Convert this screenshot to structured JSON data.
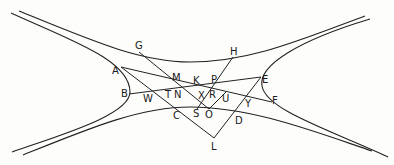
{
  "figure": {
    "width": 394,
    "height": 165,
    "stroke_color": "#222222",
    "background": "#fdfdfc"
  },
  "curves": [
    {
      "id": "upper-branch",
      "d": "M 19 11 C 90 40, 140 62, 190 62 C 250 62, 300 40, 365 16"
    },
    {
      "id": "lower-branch",
      "d": "M 23 155 C 90 128, 140 107, 190 107 C 250 107, 310 130, 372 151"
    },
    {
      "id": "left-branch",
      "d": "M 11 13 C 70 40, 130 60, 130 92 C 130 115, 60 135, 12 152"
    },
    {
      "id": "right-branch",
      "d": "M 370 19 C 300 40, 258 65, 262 86 C 266 110, 330 130, 388 157"
    }
  ],
  "segments": [
    {
      "id": "A-F",
      "x1": 121,
      "y1": 67,
      "x2": 272,
      "y2": 102
    },
    {
      "id": "B-E",
      "x1": 129,
      "y1": 94,
      "x2": 261,
      "y2": 77
    },
    {
      "id": "G-O",
      "x1": 139,
      "y1": 52,
      "x2": 209,
      "y2": 109
    },
    {
      "id": "H-S",
      "x1": 233,
      "y1": 57,
      "x2": 197,
      "y2": 109
    },
    {
      "id": "A-L",
      "x1": 121,
      "y1": 67,
      "x2": 214,
      "y2": 138
    },
    {
      "id": "E-L",
      "x1": 261,
      "y1": 77,
      "x2": 214,
      "y2": 138
    },
    {
      "id": "O-U",
      "x1": 209,
      "y1": 109,
      "x2": 226,
      "y2": 92
    }
  ],
  "labels": [
    {
      "text": "G",
      "x": 135,
      "y": 49
    },
    {
      "text": "H",
      "x": 230,
      "y": 55
    },
    {
      "text": "A",
      "x": 112,
      "y": 74
    },
    {
      "text": "M",
      "x": 172,
      "y": 81
    },
    {
      "text": "K",
      "x": 193,
      "y": 84
    },
    {
      "text": "P",
      "x": 211,
      "y": 83
    },
    {
      "text": "E",
      "x": 262,
      "y": 83
    },
    {
      "text": "B",
      "x": 121,
      "y": 97
    },
    {
      "text": "W",
      "x": 143,
      "y": 102
    },
    {
      "text": "T",
      "x": 165,
      "y": 98
    },
    {
      "text": "N",
      "x": 174,
      "y": 98
    },
    {
      "text": "X",
      "x": 198,
      "y": 99
    },
    {
      "text": "R",
      "x": 209,
      "y": 98
    },
    {
      "text": "U",
      "x": 222,
      "y": 102
    },
    {
      "text": "F",
      "x": 272,
      "y": 104
    },
    {
      "text": "Y",
      "x": 245,
      "y": 107
    },
    {
      "text": "C",
      "x": 173,
      "y": 119
    },
    {
      "text": "S",
      "x": 193,
      "y": 117
    },
    {
      "text": "O",
      "x": 205,
      "y": 118
    },
    {
      "text": "D",
      "x": 235,
      "y": 124
    },
    {
      "text": "L",
      "x": 211,
      "y": 150
    }
  ]
}
